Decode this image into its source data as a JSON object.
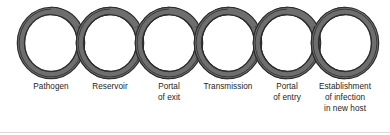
{
  "figure": {
    "type": "chain-of-infection-diagram",
    "background_color": "#ffffff",
    "link_count": 6,
    "ring_band_color": "#6e6e6e",
    "ring_outline_color": "#2b2b2b",
    "ring_inner_highlight_color": "#8a8a8a",
    "label_color": "#1d1d1d",
    "baseline_rule_color": "#d8d8d8"
  },
  "links": [
    {
      "index": 1,
      "name": "pathogen",
      "lines": [
        "Pathogen"
      ],
      "cx": 51,
      "cy": 43,
      "rx": 30,
      "ry": 32,
      "label_center_x": 51,
      "label_top_y": 81
    },
    {
      "index": 2,
      "name": "reservoir",
      "lines": [
        "Reservoir"
      ],
      "cx": 110,
      "cy": 43,
      "rx": 30,
      "ry": 32,
      "label_center_x": 110,
      "label_top_y": 81
    },
    {
      "index": 3,
      "name": "portal-of-exit",
      "lines": [
        "Portal",
        "of exit"
      ],
      "cx": 169,
      "cy": 43,
      "rx": 30,
      "ry": 32,
      "label_center_x": 169,
      "label_top_y": 81
    },
    {
      "index": 4,
      "name": "transmission",
      "lines": [
        "Transmission"
      ],
      "cx": 228,
      "cy": 43,
      "rx": 30,
      "ry": 32,
      "label_center_x": 228,
      "label_top_y": 81
    },
    {
      "index": 5,
      "name": "portal-of-entry",
      "lines": [
        "Portal",
        "of entry"
      ],
      "cx": 287,
      "cy": 43,
      "rx": 30,
      "ry": 32,
      "label_center_x": 287,
      "label_top_y": 81
    },
    {
      "index": 6,
      "name": "establishment-of-infection-in-new-host",
      "lines": [
        "Establishment",
        "of infection",
        "in new host"
      ],
      "cx": 345,
      "cy": 43,
      "rx": 30,
      "ry": 32,
      "label_center_x": 345,
      "label_top_y": 81
    }
  ]
}
